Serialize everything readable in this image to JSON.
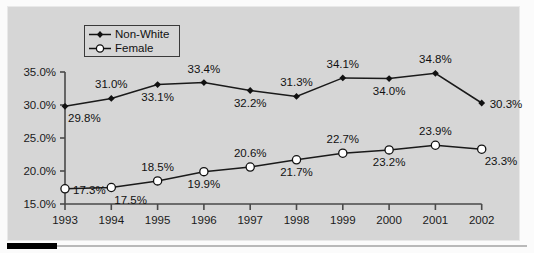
{
  "chart_data": {
    "type": "line",
    "title": "",
    "xlabel": "",
    "ylabel": "",
    "categories": [
      "1993",
      "1994",
      "1995",
      "1996",
      "1997",
      "1998",
      "1999",
      "2000",
      "2001",
      "2002"
    ],
    "ylim": [
      15.0,
      35.0
    ],
    "ytick_labels": [
      "35.0%",
      "30.0%",
      "25.0%",
      "20.0%",
      "15.0%"
    ],
    "ytick_values": [
      35.0,
      30.0,
      25.0,
      20.0,
      15.0
    ],
    "grid": false,
    "legend_position": "top-left-inside",
    "series": [
      {
        "name": "Non-White",
        "marker": "filled-diamond",
        "values": [
          29.8,
          31.0,
          33.1,
          33.4,
          32.2,
          31.3,
          34.1,
          34.0,
          34.8,
          30.3
        ],
        "labels": [
          "29.8%",
          "31.0%",
          "33.1%",
          "33.4%",
          "32.2%",
          "31.3%",
          "34.1%",
          "34.0%",
          "34.8%",
          "30.3%"
        ],
        "label_positions": [
          "below-right",
          "above",
          "below",
          "above",
          "below",
          "above",
          "above",
          "below",
          "above",
          "right"
        ]
      },
      {
        "name": "Female",
        "marker": "open-circle",
        "values": [
          17.3,
          17.5,
          18.5,
          19.9,
          20.6,
          21.7,
          22.7,
          23.2,
          23.9,
          23.3
        ],
        "labels": [
          "17.3%",
          "17.5%",
          "18.5%",
          "19.9%",
          "20.6%",
          "21.7%",
          "22.7%",
          "23.2%",
          "23.9%",
          "23.3%"
        ],
        "label_positions": [
          "right",
          "below-right",
          "above",
          "below",
          "above",
          "below",
          "above",
          "below",
          "above",
          "below-right"
        ]
      }
    ],
    "colors": {
      "background": "#d6d6d6",
      "page": "#fbfbfb",
      "line": "#1a1a1a",
      "axis": "#4a4a4a",
      "text": "#111111",
      "rule": "#000000"
    }
  },
  "legend": {
    "entries": [
      {
        "label": "Non-White",
        "marker": "filled-diamond"
      },
      {
        "label": "Female",
        "marker": "open-circle"
      }
    ]
  }
}
